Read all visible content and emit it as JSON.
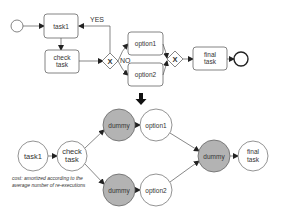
{
  "top_diagram": {
    "title": "BPMN process",
    "nodes": {
      "start": {
        "label": ""
      },
      "task1": {
        "label": "task1"
      },
      "check_task": {
        "line1": "check",
        "line2": "task"
      },
      "gateway1": {
        "symbol": "X"
      },
      "option1": {
        "label": "option1"
      },
      "option2": {
        "label": "option2"
      },
      "gateway2": {
        "symbol": "X"
      },
      "final_task": {
        "line1": "final",
        "line2": "task"
      },
      "end": {
        "label": ""
      }
    },
    "edge_labels": {
      "yes": "YES",
      "no": "NO"
    }
  },
  "transform_arrow": {
    "direction": "down"
  },
  "bottom_diagram": {
    "nodes": {
      "task1": {
        "label": "task1"
      },
      "check_task": {
        "line1": "check",
        "line2": "task"
      },
      "dummy_top": {
        "label": "dummy"
      },
      "option1": {
        "label": "option1"
      },
      "dummy_bottom": {
        "label": "dummy"
      },
      "option2": {
        "label": "option2"
      },
      "dummy_merge": {
        "label": "dummy"
      },
      "final_task": {
        "line1": "final",
        "line2": "task"
      }
    },
    "caption": {
      "line1": "cost: amortized according to the",
      "line2": "average number of re-executions"
    },
    "colors": {
      "dummy_fill": "#b3b3b3",
      "node_fill": "#ffffff",
      "stroke": "#555555"
    }
  }
}
